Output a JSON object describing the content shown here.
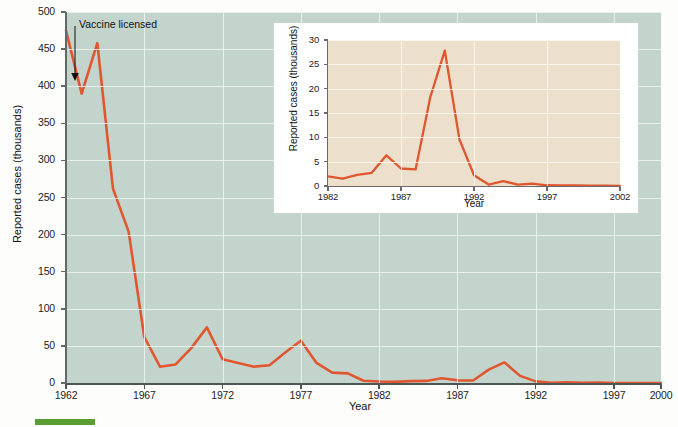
{
  "figure": {
    "background_color": "#fdfdfc"
  },
  "main_chart": {
    "title": "",
    "xlabel": "Year",
    "ylabel": "Reported cases (thousands)",
    "plot_background": "#c3d4cd",
    "line_color": "#e0562f",
    "y_ticks": [
      "0",
      "50",
      "100",
      "150",
      "200",
      "250",
      "300",
      "350",
      "400",
      "450",
      "500"
    ],
    "x_ticks": [
      "1962",
      "1967",
      "1972",
      "1977",
      "1982",
      "1987",
      "1992",
      "1997",
      "2000"
    ],
    "annotation": {
      "text": "Vaccine licensed",
      "points_to_year": 1963,
      "points_to_value": 408
    }
  },
  "inset_chart": {
    "xlabel": "Year",
    "ylabel": "Reported cases (thousands)",
    "plot_background": "#ece0cd",
    "line_color": "#e0562f",
    "box_background": "#ffffff",
    "y_ticks": [
      "0",
      "5",
      "10",
      "15",
      "20",
      "25",
      "30"
    ],
    "x_ticks": [
      "1982",
      "1987",
      "1992",
      "1997",
      "2002"
    ]
  },
  "chart_data": [
    {
      "type": "line",
      "id": "main",
      "title": "Reported measles cases in the United States, 1962-2000",
      "xlabel": "Year",
      "ylabel": "Reported cases (thousands)",
      "xlim": [
        1962,
        2000
      ],
      "ylim": [
        0,
        500
      ],
      "ytick_step": 50,
      "xtick_step": 5,
      "grid": true,
      "legend": "none",
      "line_color": "#e0562f",
      "plot_background": "#c3d4cd",
      "annotations": [
        {
          "text": "Vaccine licensed",
          "x": 1963,
          "y": 408,
          "arrow": true
        }
      ],
      "x": [
        1962,
        1963,
        1964,
        1965,
        1966,
        1967,
        1968,
        1969,
        1970,
        1971,
        1972,
        1973,
        1974,
        1975,
        1976,
        1977,
        1978,
        1979,
        1980,
        1981,
        1982,
        1983,
        1984,
        1985,
        1986,
        1987,
        1988,
        1989,
        1990,
        1991,
        1992,
        1993,
        1994,
        1995,
        1996,
        1997,
        1998,
        1999,
        2000
      ],
      "values": [
        475,
        390,
        458,
        262,
        204,
        62,
        22,
        25,
        47,
        75,
        32,
        27,
        22,
        24,
        41,
        57,
        27,
        14,
        13,
        3,
        2,
        1.5,
        2.5,
        2.8,
        6.3,
        3.6,
        3.4,
        18,
        27.8,
        9.6,
        2.2,
        0.3,
        1,
        0.3,
        0.5,
        0.1,
        0.1,
        0.1,
        0.1
      ]
    },
    {
      "type": "line",
      "id": "inset",
      "title": "",
      "xlabel": "Year",
      "ylabel": "Reported cases (thousands)",
      "xlim": [
        1982,
        2002
      ],
      "ylim": [
        0,
        30
      ],
      "ytick_step": 5,
      "xtick_step": 5,
      "grid": true,
      "legend": "none",
      "line_color": "#e0562f",
      "plot_background": "#ece0cd",
      "x": [
        1982,
        1983,
        1984,
        1985,
        1986,
        1987,
        1988,
        1989,
        1990,
        1991,
        1992,
        1993,
        1994,
        1995,
        1996,
        1997,
        1998,
        1999,
        2000,
        2001,
        2002
      ],
      "values": [
        2.0,
        1.5,
        2.3,
        2.7,
        6.3,
        3.6,
        3.4,
        18.2,
        27.8,
        9.6,
        2.2,
        0.3,
        1.0,
        0.3,
        0.5,
        0.15,
        0.1,
        0.1,
        0.09,
        0.08,
        0.04
      ]
    }
  ]
}
